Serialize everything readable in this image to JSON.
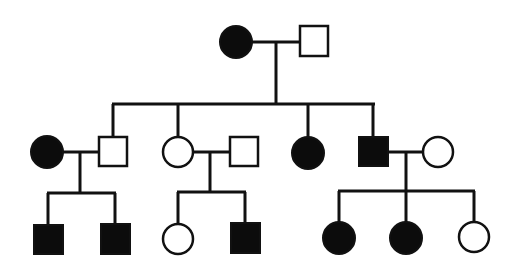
{
  "diagram": {
    "type": "pedigree",
    "colors": {
      "affected": "#0c0c0c",
      "unaffected": "#ffffff",
      "line": "#111111"
    },
    "generations": [
      {
        "id": "I",
        "individuals": [
          {
            "id": "I-1",
            "sex": "female",
            "shape": "circle",
            "affected": true
          },
          {
            "id": "I-2",
            "sex": "male",
            "shape": "square",
            "affected": false
          }
        ]
      },
      {
        "id": "II",
        "individuals": [
          {
            "id": "II-1",
            "sex": "female",
            "shape": "circle",
            "affected": true,
            "note": "married-in spouse"
          },
          {
            "id": "II-2",
            "sex": "male",
            "shape": "square",
            "affected": false,
            "parents": [
              "I-1",
              "I-2"
            ]
          },
          {
            "id": "II-3",
            "sex": "female",
            "shape": "circle",
            "affected": false,
            "parents": [
              "I-1",
              "I-2"
            ]
          },
          {
            "id": "II-4",
            "sex": "male",
            "shape": "square",
            "affected": false,
            "note": "married-in spouse"
          },
          {
            "id": "II-5",
            "sex": "female",
            "shape": "circle",
            "affected": true,
            "parents": [
              "I-1",
              "I-2"
            ]
          },
          {
            "id": "II-6",
            "sex": "male",
            "shape": "square",
            "affected": true,
            "parents": [
              "I-1",
              "I-2"
            ]
          },
          {
            "id": "II-7",
            "sex": "female",
            "shape": "circle",
            "affected": false,
            "note": "married-in spouse"
          }
        ]
      },
      {
        "id": "III",
        "individuals": [
          {
            "id": "III-1",
            "sex": "male",
            "shape": "square",
            "affected": true,
            "parents": [
              "II-1",
              "II-2"
            ]
          },
          {
            "id": "III-2",
            "sex": "male",
            "shape": "square",
            "affected": true,
            "parents": [
              "II-1",
              "II-2"
            ]
          },
          {
            "id": "III-3",
            "sex": "female",
            "shape": "circle",
            "affected": false,
            "parents": [
              "II-3",
              "II-4"
            ]
          },
          {
            "id": "III-4",
            "sex": "male",
            "shape": "square",
            "affected": true,
            "parents": [
              "II-3",
              "II-4"
            ]
          },
          {
            "id": "III-5",
            "sex": "female",
            "shape": "circle",
            "affected": true,
            "parents": [
              "II-6",
              "II-7"
            ]
          },
          {
            "id": "III-6",
            "sex": "female",
            "shape": "circle",
            "affected": true,
            "parents": [
              "II-6",
              "II-7"
            ]
          },
          {
            "id": "III-7",
            "sex": "female",
            "shape": "circle",
            "affected": false,
            "parents": [
              "II-6",
              "II-7"
            ]
          }
        ]
      }
    ],
    "couples": [
      [
        "I-1",
        "I-2"
      ],
      [
        "II-1",
        "II-2"
      ],
      [
        "II-3",
        "II-4"
      ],
      [
        "II-6",
        "II-7"
      ]
    ]
  }
}
